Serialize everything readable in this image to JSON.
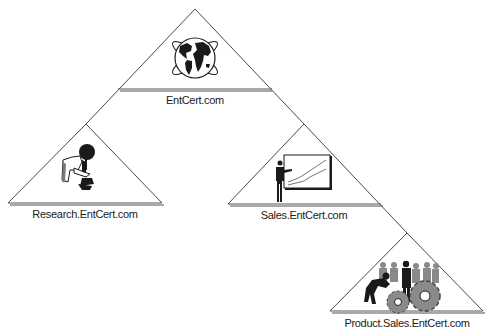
{
  "diagram": {
    "type": "domain-tree",
    "nodes": [
      {
        "id": "root",
        "label": "EntCert.com",
        "icon": "globe-icon",
        "apex": [
          195,
          9
        ],
        "base_y": 89,
        "base_x": [
          118,
          272
        ],
        "label_pos": [
          195,
          104
        ]
      },
      {
        "id": "research",
        "label": "Research.EntCert.com",
        "icon": "scientist-microscope-icon",
        "apex": [
          86,
          124
        ],
        "base_y": 203,
        "base_x": [
          8,
          162
        ],
        "label_pos": [
          85,
          218
        ]
      },
      {
        "id": "sales",
        "label": "Sales.EntCert.com",
        "icon": "presenter-chart-icon",
        "apex": [
          304,
          124
        ],
        "base_y": 204,
        "base_x": [
          228,
          381
        ],
        "label_pos": [
          304,
          219
        ]
      },
      {
        "id": "product",
        "label": "Product.Sales.EntCert.com",
        "icon": "workers-gears-icon",
        "apex": [
          407,
          233
        ],
        "base_y": 311,
        "base_x": [
          330,
          483
        ],
        "label_pos": [
          407,
          327
        ]
      }
    ],
    "edges": [
      {
        "from": "root",
        "to": "research"
      },
      {
        "from": "root",
        "to": "sales"
      },
      {
        "from": "sales",
        "to": "product"
      }
    ],
    "colors": {
      "line": "#4a4a4a",
      "shadow": "#a8a8a8",
      "icon": "#1a1a1a",
      "icon_gray": "#8a8a8a"
    }
  },
  "labels": {
    "root": "EntCert.com",
    "research": "Research.EntCert.com",
    "sales": "Sales.EntCert.com",
    "product": "Product.Sales.EntCert.com"
  }
}
